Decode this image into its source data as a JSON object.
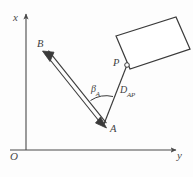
{
  "figure": {
    "type": "mechanism-kinematics-diagram",
    "background_color": "#fdfdfd",
    "stroke_color": "#3a3a3a",
    "axes": {
      "origin_label": "O",
      "vertical_axis_label": "x",
      "horizontal_axis_label": "y"
    },
    "points": {
      "a_label": "A",
      "b_label": "B",
      "p_label": "P"
    },
    "annotations": {
      "angle_symbol": "β",
      "angle_subscript": "A",
      "distance_symbol": "D",
      "distance_subscript": "AP"
    },
    "elements": [
      {
        "name": "link-ab",
        "description": "double-line rigid link from A to B with arrowheads at both ends"
      },
      {
        "name": "link-ap",
        "description": "single line from A to joint P"
      },
      {
        "name": "body-panel",
        "description": "tilted rectangular rigid body attached at P"
      },
      {
        "name": "angle-arc",
        "description": "arc at A between link AB and link AP"
      }
    ]
  }
}
